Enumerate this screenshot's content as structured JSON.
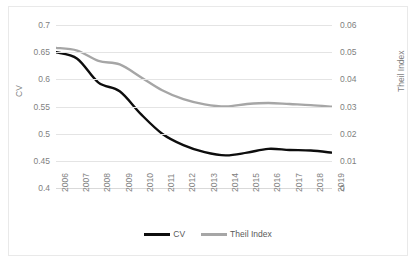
{
  "chart_data": {
    "type": "line",
    "title": "",
    "xlabel": "",
    "grid": true,
    "legend_position": "bottom",
    "categories": [
      "2006",
      "2007",
      "2008",
      "2009",
      "2010",
      "2011",
      "2012",
      "2013",
      "2014",
      "2015",
      "2016",
      "2017",
      "2018",
      "2019"
    ],
    "axes": {
      "left": {
        "label": "CV",
        "ylim": [
          0.4,
          0.7
        ],
        "ticks": [
          "0.4",
          "0.45",
          "0.5",
          "0.55",
          "0.6",
          "0.65",
          "0.7"
        ],
        "tick_values": [
          0.4,
          0.45,
          0.5,
          0.55,
          0.6,
          0.65,
          0.7
        ]
      },
      "right": {
        "label": "Theil Index",
        "ylim": [
          0,
          0.06
        ],
        "ticks": [
          "0",
          "0.01",
          "0.02",
          "0.03",
          "0.04",
          "0.05",
          "0.06"
        ],
        "tick_values": [
          0,
          0.01,
          0.02,
          0.03,
          0.04,
          0.05,
          0.06
        ]
      }
    },
    "series": [
      {
        "name": "CV",
        "axis": "left",
        "color": "#0d0d0d",
        "values": [
          0.65,
          0.638,
          0.594,
          0.578,
          0.536,
          0.5,
          0.479,
          0.466,
          0.46,
          0.465,
          0.472,
          0.47,
          0.469,
          0.465
        ]
      },
      {
        "name": "Theil Index",
        "axis": "right",
        "color": "#a6a6a6",
        "values": [
          0.0516,
          0.0506,
          0.0468,
          0.0455,
          0.0408,
          0.036,
          0.0327,
          0.0308,
          0.03,
          0.0309,
          0.0313,
          0.0309,
          0.0305,
          0.0299
        ]
      }
    ]
  },
  "legend": {
    "items": [
      {
        "label": "CV",
        "color": "#0d0d0d"
      },
      {
        "label": "Theil Index",
        "color": "#a6a6a6"
      }
    ]
  }
}
